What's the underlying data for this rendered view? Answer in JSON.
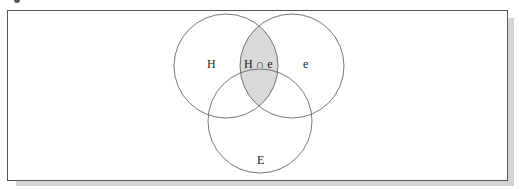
{
  "diagram": {
    "type": "venn",
    "sets": [
      {
        "id": "H",
        "label": "H"
      },
      {
        "id": "e",
        "label": "e"
      },
      {
        "id": "E",
        "label": "E"
      }
    ],
    "highlighted_region": {
      "label": "H ∩ e",
      "sets": [
        "H",
        "e"
      ],
      "fill": "#d9d9d9"
    },
    "colors": {
      "stroke": "#555555",
      "highlight": "#d9d9d9",
      "background": "#ffffff",
      "shadow": "#d4d4d4"
    }
  }
}
